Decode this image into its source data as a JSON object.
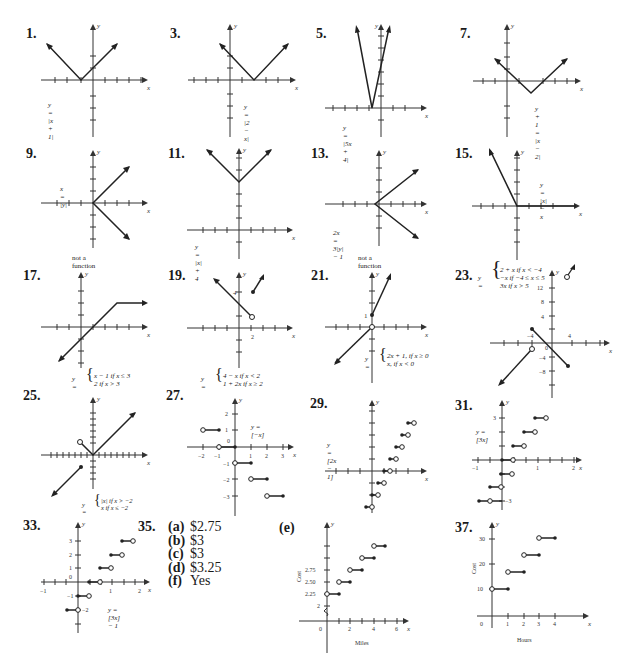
{
  "page": {
    "header_fragment": "(page 2)"
  },
  "problems": [
    {
      "num": "1.",
      "equation": "y = |x + 1|",
      "note": ""
    },
    {
      "num": "3.",
      "equation": "y = |2 − x|",
      "note": ""
    },
    {
      "num": "5.",
      "equation": "y = |5x + 4|",
      "note": ""
    },
    {
      "num": "7.",
      "equation": "y + 1 = |x − 2|",
      "note": ""
    },
    {
      "num": "9.",
      "equation": "x = |y|",
      "note": "not a function"
    },
    {
      "num": "11.",
      "equation": "y = |x| + 4",
      "note": ""
    },
    {
      "num": "13.",
      "equation": "2x = 3|y| − 1",
      "note": "not a function"
    },
    {
      "num": "15.",
      "equation": "y = |x| − x",
      "note": ""
    },
    {
      "num": "17.",
      "equation_lines": [
        "x − 1 if x ≤ 3",
        "2 if x > 3"
      ],
      "note": ""
    },
    {
      "num": "19.",
      "equation_lines": [
        "4 − x if x < 2",
        "1 + 2x if x ≥ 2"
      ],
      "point_label": "4",
      "tick_label": "2",
      "note": ""
    },
    {
      "num": "21.",
      "equation_lines": [
        "2x + 1, if x ≥ 0",
        "x, if x < 0"
      ],
      "point_label": "1",
      "note": ""
    },
    {
      "num": "23.",
      "equation_lines": [
        "2 + x if x < −4",
        "−x if −4 ≤ x ≤ 5",
        "3x  if x > 5"
      ],
      "y_ticks": [
        "12",
        "8",
        "4",
        "0",
        "−4",
        "−8"
      ],
      "x_ticks": [
        "−4",
        "4"
      ],
      "note": ""
    },
    {
      "num": "25.",
      "equation_lines": [
        "|x| if x > −2",
        "x if x ≤ −2"
      ],
      "note": ""
    },
    {
      "num": "27.",
      "equation": "y = [−x]",
      "x_ticks": [
        "−2",
        "−1",
        "0",
        "1",
        "2",
        "3"
      ],
      "y_ticks": [
        "2",
        "1",
        "0",
        "−1",
        "−2",
        "−3"
      ],
      "note": ""
    },
    {
      "num": "29.",
      "equation": "y = [2x − 1]",
      "note": ""
    },
    {
      "num": "31.",
      "equation": "y = [3x]",
      "x_ticks": [
        "−1",
        "1",
        "2"
      ],
      "y_ticks": [
        "3",
        "−3"
      ],
      "note": ""
    },
    {
      "num": "33.",
      "equation": "y = [3x] − 1",
      "x_ticks": [
        "−1",
        "1",
        "2"
      ],
      "y_ticks": [
        "3",
        "2",
        "1",
        "0",
        "−1",
        "−2"
      ],
      "note": ""
    }
  ],
  "problem35": {
    "num": "35.",
    "answers": [
      {
        "label": "(a)",
        "value": "$2.75"
      },
      {
        "label": "(b)",
        "value": "$3"
      },
      {
        "label": "(c)",
        "value": "$3"
      },
      {
        "label": "(d)",
        "value": "$3.25"
      },
      {
        "label": "(f)",
        "value": "Yes"
      }
    ],
    "graph_e": {
      "label": "(e)",
      "xlabel": "Miles",
      "ylabel": "Cost",
      "y_ticks": [
        "2.75",
        "2.50",
        "2.25",
        "2"
      ],
      "x_ticks": [
        "0",
        "2",
        "4",
        "6"
      ]
    }
  },
  "problem37": {
    "num": "37.",
    "xlabel": "Hours",
    "ylabel": "Cost",
    "y_ticks": [
      "30",
      "20",
      "10"
    ],
    "x_ticks": [
      "0",
      "1",
      "2",
      "3",
      "4"
    ]
  },
  "axis_labels": {
    "x": "x",
    "y": "y"
  },
  "colors": {
    "ink": "#1a1a1a",
    "axis": "#333333",
    "paper": "#ffffff"
  }
}
